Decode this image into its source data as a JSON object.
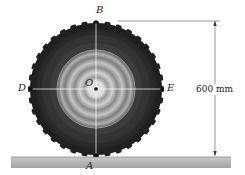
{
  "figure": {
    "points": {
      "top": "B",
      "bottom": "A",
      "left": "D",
      "right": "E",
      "center": "O"
    },
    "dimension": {
      "label": "600 mm"
    },
    "colors": {
      "ground": "#b5b5b5",
      "tread": "#2a2a2a",
      "rim": "#c8c8c8",
      "lines": "#ffffff",
      "points": "#111111"
    }
  }
}
